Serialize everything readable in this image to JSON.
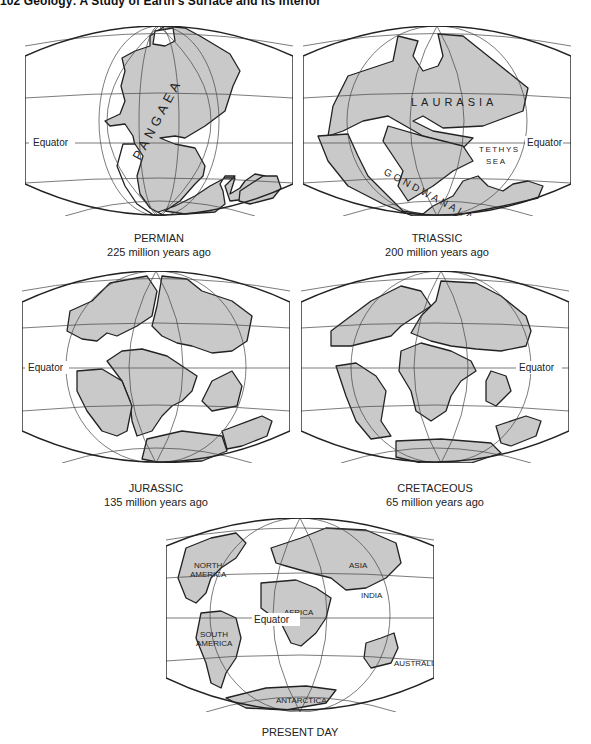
{
  "header": {
    "text": "102   Geology: A Study of Earth's Surface and Its Interior"
  },
  "figure": {
    "land_color": "#c9c9c9",
    "ocean_color": "#ffffff",
    "line_color": "#222222",
    "panels": [
      {
        "id": "permian",
        "period": "PERMIAN",
        "age": "225 million years ago",
        "labels": {
          "equator": "Equator",
          "supercontinent": "PANGAEA"
        }
      },
      {
        "id": "triassic",
        "period": "TRIASSIC",
        "age": "200 million years ago",
        "labels": {
          "equator": "Equator",
          "north": "LAURASIA",
          "south": "GONDWANALAND",
          "sea_line1": "TETHYS",
          "sea_line2": "SEA"
        }
      },
      {
        "id": "jurassic",
        "period": "JURASSIC",
        "age": "135 million years ago",
        "labels": {
          "equator": "Equator"
        }
      },
      {
        "id": "cretaceous",
        "period": "CRETACEOUS",
        "age": "65 million years ago",
        "labels": {
          "equator": "Equator"
        }
      },
      {
        "id": "present",
        "period": "PRESENT DAY",
        "age": "",
        "labels": {
          "equator": "Equator",
          "north_america_1": "NORTH",
          "north_america_2": "AMERICA",
          "south_america_1": "SOUTH",
          "south_america_2": "AMERICA",
          "africa": "AFRICA",
          "asia": "ASIA",
          "india": "INDIA",
          "australia": "AUSTRALIA",
          "antarctica": "ANTARCTICA"
        }
      }
    ]
  }
}
